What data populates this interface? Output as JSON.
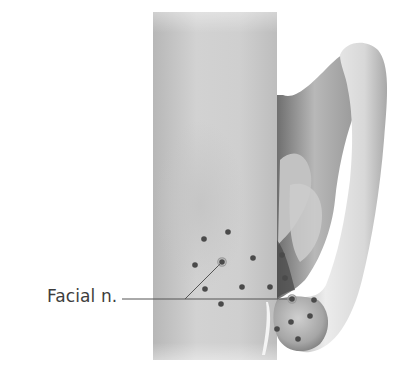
{
  "figure": {
    "labels": [
      {
        "text": "Facial n.",
        "target": "facial-nerve"
      }
    ],
    "colors": {
      "background": "#ffffff",
      "neck_light": "#d4d4d4",
      "neck_dark": "#a9a9a9",
      "ear_light": "#e6e6e6",
      "ear_dark": "#8a8a8a",
      "dot": "#4a4a4a",
      "leader_line": "#555555",
      "label_text": "#3d3d3d"
    },
    "injection_points": [
      {
        "x": 204,
        "y": 239
      },
      {
        "x": 228,
        "y": 232
      },
      {
        "x": 195,
        "y": 265
      },
      {
        "x": 222,
        "y": 262,
        "ringed": true
      },
      {
        "x": 253,
        "y": 258
      },
      {
        "x": 205,
        "y": 289
      },
      {
        "x": 242,
        "y": 287
      },
      {
        "x": 270,
        "y": 287
      },
      {
        "x": 282,
        "y": 255
      },
      {
        "x": 285,
        "y": 278
      },
      {
        "x": 221,
        "y": 304
      },
      {
        "x": 292,
        "y": 299,
        "ringed": true
      },
      {
        "x": 314,
        "y": 300
      },
      {
        "x": 310,
        "y": 316
      },
      {
        "x": 291,
        "y": 322
      },
      {
        "x": 277,
        "y": 329
      },
      {
        "x": 298,
        "y": 339
      }
    ]
  }
}
